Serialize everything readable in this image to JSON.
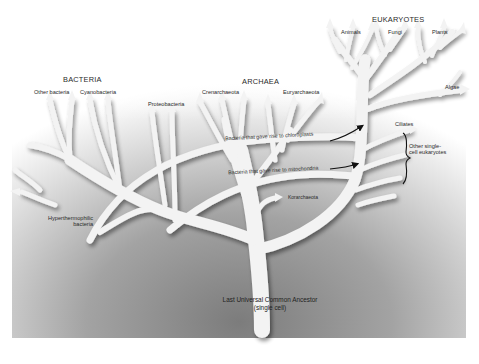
{
  "diagram": {
    "type": "phylogenetic-tree",
    "colors": {
      "branch_fill": "#f2f2f2",
      "background_dark": "#8c8c8c",
      "background_light": "#ffffff",
      "text": "#2a2a2a",
      "arrow": "#111111"
    },
    "groups": {
      "bacteria": "BACTERIA",
      "archaea": "ARCHAEA",
      "eukaryotes": "EUKARYOTES"
    },
    "leaves": {
      "other_bacteria": "Other bacteria",
      "cyanobacteria": "Cyanobacteria",
      "proteobacteria": "Proteobacteria",
      "crenarchaeota": "Crenarchaeota",
      "euryarchaeota": "Euryarchaeota",
      "animals": "Animals",
      "fungi": "Fungi",
      "plants": "Plants",
      "algae": "Algae",
      "ciliates": "Ciliates",
      "other_single_cell_line1": "Other single-",
      "other_single_cell_line2": "cell eukaryotes",
      "hyperthermophilic_line1": "Hyperthermophilic",
      "hyperthermophilic_line2": "bacteria",
      "korarchaeota": "Korarchaeota"
    },
    "transfers": {
      "chloroplasts": "Bacteria that gave rise to chloroplasts",
      "mitochondria": "Bacteria that gave rise to mitochondria"
    },
    "root": {
      "line1": "Last Universal Common Ancestor",
      "line2": "(single cell)"
    }
  }
}
